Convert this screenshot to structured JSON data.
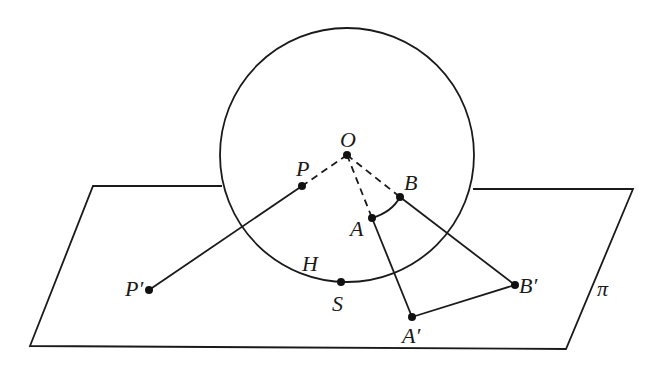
{
  "diagram": {
    "type": "stereographic-projection",
    "colors": {
      "ink": "#1a1a1a",
      "background": "#ffffff"
    },
    "sphere": {
      "center": [
        347,
        155
      ],
      "radius": 127
    },
    "plane": {
      "label": "π",
      "corners": [
        [
          93,
          186
        ],
        [
          633,
          189
        ],
        [
          566,
          349
        ],
        [
          30,
          346
        ]
      ]
    },
    "points": {
      "O": {
        "label": "O",
        "pos": [
          347,
          155
        ]
      },
      "P": {
        "label": "P",
        "pos": [
          302,
          186
        ]
      },
      "P_prime": {
        "label": "P′",
        "pos": [
          149,
          290
        ]
      },
      "A": {
        "label": "A",
        "pos": [
          372,
          218
        ]
      },
      "A_prime": {
        "label": "A′",
        "pos": [
          412,
          317
        ]
      },
      "B": {
        "label": "B",
        "pos": [
          400,
          197
        ]
      },
      "B_prime": {
        "label": "B′",
        "pos": [
          515,
          285
        ]
      },
      "S": {
        "label": "S",
        "pos": [
          341,
          282
        ]
      }
    },
    "annotations": {
      "H": {
        "label": "H"
      }
    },
    "segments": {
      "dashed": [
        "O-P",
        "O-A",
        "O-B"
      ],
      "solid": [
        "P-P′",
        "A-A′",
        "B-B′",
        "A′-B′"
      ],
      "arc": [
        "A-B"
      ]
    }
  }
}
